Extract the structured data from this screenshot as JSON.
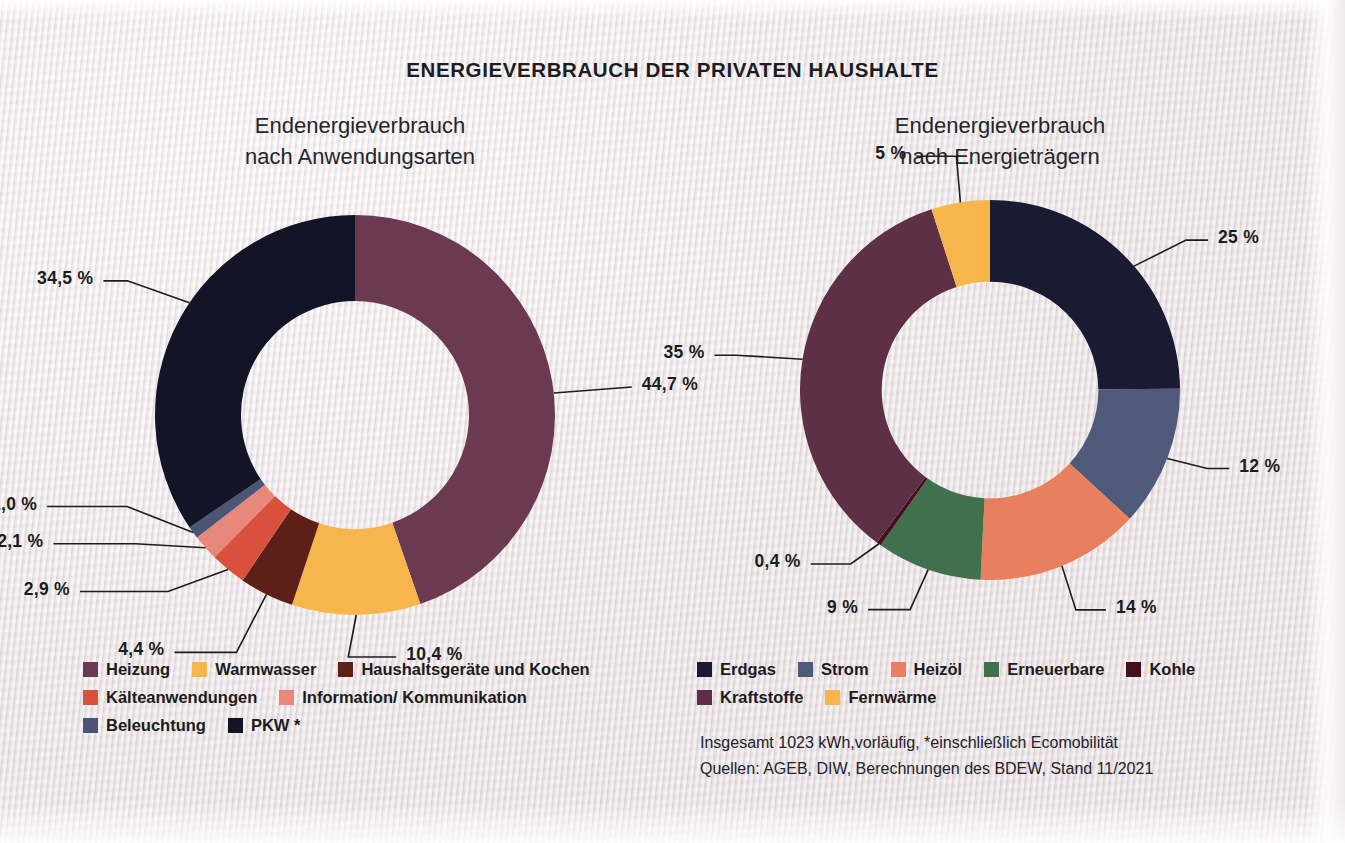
{
  "title": "ENERGIEVERBRAUCH DER PRIVATEN HAUSHALTE",
  "panels": {
    "left": {
      "subtitle_line1": "Endenergieverbrauch",
      "subtitle_line2": "nach Anwendungsarten"
    },
    "right": {
      "subtitle_line1": "Endenergieverbrauch",
      "subtitle_line2": "nach Energieträgern"
    }
  },
  "footnotes": [
    "Insgesamt 1023 kWh,vorläufig, *einschließlich Ecomobilität",
    "Quellen: AGEB, DIW, Berechnungen des BDEW, Stand 11/2021"
  ],
  "chart_data": [
    {
      "type": "pie",
      "variant": "donut",
      "title": "Endenergieverbrauch nach Anwendungsarten",
      "categories": [
        "Heizung",
        "Warmwasser",
        "Haushaltsgeräte und Kochen",
        "Kälteanwendungen",
        "Information/ Kommunikation",
        "Beleuchtung",
        "PKW *"
      ],
      "values": [
        44.7,
        10.4,
        4.4,
        2.9,
        2.1,
        1.0,
        34.5
      ],
      "value_labels": [
        "44,7 %",
        "10,4 %",
        "4,4 %",
        "2,9 %",
        "2,1 %",
        "1,0 %",
        "34,5 %"
      ],
      "unit": "%",
      "colors": [
        "#6b3a52",
        "#f6b64b",
        "#5c2018",
        "#d9503c",
        "#e8887a",
        "#4b5575",
        "#141427"
      ],
      "legend_position": "bottom"
    },
    {
      "type": "pie",
      "variant": "donut",
      "title": "Endenergieverbrauch nach Energieträgern",
      "categories": [
        "Erdgas",
        "Strom",
        "Heizöl",
        "Erneuerbare",
        "Kohle",
        "Kraftstoffe",
        "Fernwärme"
      ],
      "values": [
        25,
        12,
        14,
        9,
        0.4,
        35,
        5
      ],
      "value_labels": [
        "25 %",
        "12 %",
        "14 %",
        "9 %",
        "0,4 %",
        "35 %",
        "5 %"
      ],
      "unit": "%",
      "colors": [
        "#1a1a33",
        "#4f5a7a",
        "#e8805f",
        "#41704f",
        "#45101a",
        "#5e3048",
        "#f6b64b"
      ],
      "legend_position": "bottom"
    }
  ]
}
